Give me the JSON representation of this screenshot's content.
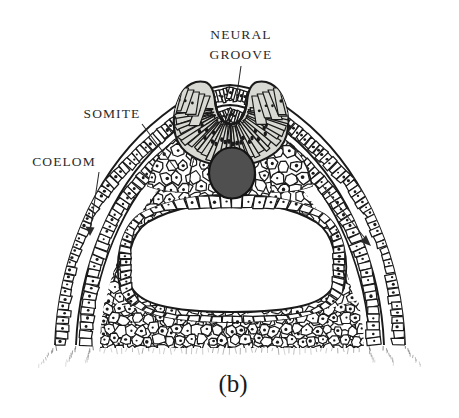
{
  "figure": {
    "caption": "(b)",
    "title_alt": "Embryo cross-section at neural groove stage",
    "background_color": "#ffffff",
    "ink_color": "#1a1a1a"
  },
  "labels": [
    {
      "id": "neural-groove",
      "lines": [
        "NEURAL",
        "GROOVE"
      ],
      "line1": "NEURAL",
      "line2": "GROOVE",
      "x": 241,
      "y": 41,
      "leader": {
        "x1": 241,
        "y1": 62,
        "x2": 237,
        "y2": 100,
        "arrow": false
      }
    },
    {
      "id": "somite",
      "lines": [
        "SOMITE"
      ],
      "line1": "SOMITE",
      "line2": "",
      "x": 112,
      "y": 115,
      "leader": {
        "x1": 139,
        "y1": 124,
        "x2": 176,
        "y2": 170,
        "arrow": false
      }
    },
    {
      "id": "coelom",
      "lines": [
        "COELOM"
      ],
      "line1": "COELOM",
      "line2": "",
      "x": 64,
      "y": 162,
      "leader": {
        "x1": 97,
        "y1": 170,
        "x2": 90,
        "y2": 233,
        "arrow": true
      }
    }
  ],
  "structures": {
    "neural_groove": {
      "name": "neural groove",
      "fill_color": "#d9d9d4",
      "cell_type": "radial columnar neuroepithelium"
    },
    "notochord": {
      "name": "notochord",
      "fill_color": "#4f4f4f",
      "outline_color": "#141414",
      "cx": 232,
      "cy": 172,
      "rx": 22,
      "ry": 25
    },
    "archenteron": {
      "name": "archenteron cavity",
      "fill_color": "#ffffff",
      "lining": "cuboidal endoderm"
    },
    "somite": {
      "name": "somite",
      "fill_color": "#ffffff"
    },
    "coelom": {
      "name": "coelom",
      "fill_color": "#ffffff",
      "description": "narrow slit between somatic and splanchnic mesoderm"
    },
    "ectoderm": {
      "name": "ectoderm",
      "fill_color": "#ffffff"
    }
  },
  "colors": {
    "ink": "#1a1a1a",
    "label_ink": "#2b2b2b",
    "neural_fill": "#d9d9d4",
    "notochord_fill": "#4f4f4f",
    "paper": "#ffffff"
  }
}
